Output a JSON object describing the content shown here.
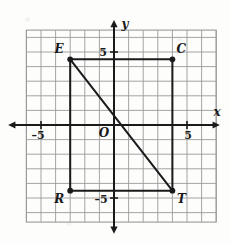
{
  "figure": {
    "type": "coordinate-plane",
    "axes": {
      "x_label": "x",
      "y_label": "y",
      "origin_label": "O",
      "x_ticks": [
        {
          "value": -5,
          "label": "–5"
        },
        {
          "value": 5,
          "label": "5"
        }
      ],
      "y_ticks": [
        {
          "value": 5,
          "label": "5"
        },
        {
          "value": -5,
          "label": "–5"
        }
      ],
      "x_range": [
        -6.4,
        6.6
      ],
      "y_range": [
        -6.55,
        6.5
      ],
      "grid": true,
      "grid_step": 1
    },
    "points": [
      {
        "name": "E",
        "label": "E",
        "x": -3,
        "y": 4.5,
        "label_dx": -11,
        "label_dy": -6
      },
      {
        "name": "C",
        "label": "C",
        "x": 4,
        "y": 4.5,
        "label_dx": 9,
        "label_dy": -6
      },
      {
        "name": "R",
        "label": "R",
        "x": -3,
        "y": -4.5,
        "label_dx": -11,
        "label_dy": 12
      },
      {
        "name": "T",
        "label": "T",
        "x": 4,
        "y": -4.5,
        "label_dx": 9,
        "label_dy": 12
      }
    ],
    "segments": [
      {
        "name": "segment-EC",
        "from": "E",
        "to": "C"
      },
      {
        "name": "segment-ER",
        "from": "E",
        "to": "R"
      },
      {
        "name": "segment-RT",
        "from": "R",
        "to": "T"
      },
      {
        "name": "segment-CT",
        "from": "C",
        "to": "T"
      },
      {
        "name": "segment-ET-diagonal",
        "from": "E",
        "to": "T"
      }
    ],
    "colors": {
      "background": "#fdfdfc",
      "grid_line": "#9a9a9a",
      "axis_line": "#1a1a1a",
      "shape_line": "#1a1a1a",
      "label_text": "#1a1a1a"
    }
  }
}
